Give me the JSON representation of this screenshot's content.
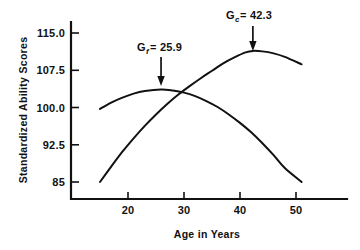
{
  "chart_data": {
    "type": "line",
    "title": "",
    "xlabel": "Age in Years",
    "ylabel": "Standardized Ability Scores",
    "xlim": [
      13,
      57
    ],
    "ylim": [
      82,
      117
    ],
    "xticks": [
      "20",
      "30",
      "40",
      "50"
    ],
    "xtick_values": [
      20,
      30,
      40,
      50
    ],
    "yticks": [
      "115.0",
      "107.5",
      "100.0",
      "92.5",
      "85"
    ],
    "ytick_values": [
      115.0,
      107.5,
      100.0,
      92.5,
      85.0
    ],
    "grid": false,
    "legend": "none",
    "series": [
      {
        "name": "Gf",
        "label": "G",
        "subscript": "f",
        "peak_age": 25.9,
        "peak_label": "25.9",
        "points": [
          [
            15,
            99.7
          ],
          [
            17,
            101.0
          ],
          [
            19,
            102.0
          ],
          [
            21,
            102.8
          ],
          [
            23,
            103.3
          ],
          [
            25.9,
            103.6
          ],
          [
            28,
            103.4
          ],
          [
            30,
            103.0
          ],
          [
            32,
            102.3
          ],
          [
            34,
            101.3
          ],
          [
            36,
            100.1
          ],
          [
            38,
            98.6
          ],
          [
            40,
            96.9
          ],
          [
            42,
            95.0
          ],
          [
            44,
            92.8
          ],
          [
            46,
            90.4
          ],
          [
            48,
            87.8
          ],
          [
            51,
            85.0
          ]
        ]
      },
      {
        "name": "Gc",
        "label": "G",
        "subscript": "c",
        "peak_age": 42.3,
        "peak_label": "42.3",
        "points": [
          [
            15,
            85.0
          ],
          [
            17,
            88.1
          ],
          [
            19,
            91.1
          ],
          [
            21,
            93.8
          ],
          [
            23,
            96.3
          ],
          [
            25,
            98.6
          ],
          [
            27,
            100.7
          ],
          [
            29,
            102.6
          ],
          [
            31,
            104.3
          ],
          [
            33,
            105.9
          ],
          [
            35,
            107.4
          ],
          [
            37,
            108.9
          ],
          [
            39,
            110.1
          ],
          [
            41,
            111.1
          ],
          [
            42.3,
            111.4
          ],
          [
            44,
            111.3
          ],
          [
            46,
            110.9
          ],
          [
            48,
            110.2
          ],
          [
            51,
            108.7
          ]
        ]
      }
    ],
    "annotations": [
      {
        "id": "gf-annotation",
        "text_prefix": "G",
        "text_sub": "f",
        "text_suffix": "= 25.9",
        "full_text": "Gf = 25.9",
        "target_age": 25.9,
        "arrow": "down"
      },
      {
        "id": "gc-annotation",
        "text_prefix": "G",
        "text_sub": "c",
        "text_suffix": "= 42.3",
        "full_text": "Gc = 42.3",
        "target_age": 42.3,
        "arrow": "down"
      }
    ],
    "colors": {
      "ink": "#111111",
      "background": "#ffffff"
    }
  }
}
